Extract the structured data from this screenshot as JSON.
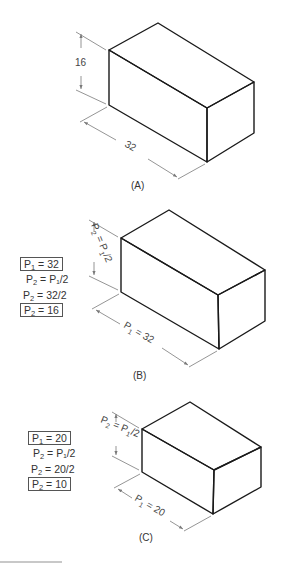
{
  "figure": {
    "panels": [
      {
        "id": "A",
        "caption": "(A)",
        "height_label": "16",
        "length_label": "32"
      },
      {
        "id": "B",
        "caption": "(B)",
        "height_label": {
          "main": "P",
          "sub1": "2",
          "mid": " = P",
          "sub2": "1",
          "tail": "/2"
        },
        "length_label": {
          "main": "P",
          "sub": "1",
          "tail": " = 32"
        },
        "calc": [
          {
            "pre": "P",
            "sub": "1",
            "post": " = 32",
            "boxed": true
          },
          {
            "pre": "P",
            "sub": "2",
            "post": " = P₁/2",
            "boxed": false
          },
          {
            "pre": "P",
            "sub": "2",
            "post": " = 32/2",
            "boxed": false
          },
          {
            "pre": "P",
            "sub": "2",
            "post": " = 16",
            "boxed": true
          }
        ]
      },
      {
        "id": "C",
        "caption": "(C)",
        "height_label": {
          "main": "P",
          "sub1": "2",
          "mid": " = P",
          "sub2": "1",
          "tail": "/2"
        },
        "length_label": {
          "main": "P",
          "sub": "1",
          "tail": " = 20"
        },
        "calc": [
          {
            "pre": "P",
            "sub": "1",
            "post": " = 20",
            "boxed": true
          },
          {
            "pre": "P",
            "sub": "2",
            "post": " = P₁/2",
            "boxed": false
          },
          {
            "pre": "P",
            "sub": "2",
            "post": " = 20/2",
            "boxed": false
          },
          {
            "pre": "P",
            "sub": "2",
            "post": " = 10",
            "boxed": true
          }
        ]
      }
    ],
    "colors": {
      "edge": "#1a1a1a",
      "dimension": "#7a7a7a",
      "text": "#333333"
    }
  }
}
